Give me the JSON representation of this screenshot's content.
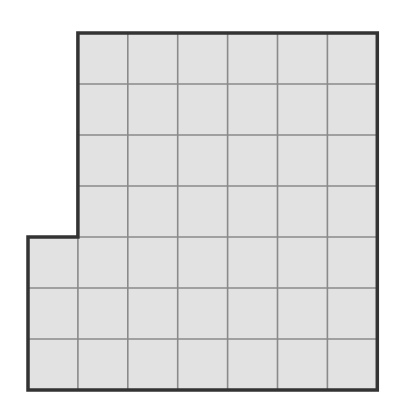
{
  "figure": {
    "type": "grid-polyomino",
    "grid": {
      "origin_x": 28,
      "origin_y": 33,
      "cell_w": 49.9,
      "cell_h": 51,
      "cols": 7,
      "rows": 7
    },
    "cells": [
      [
        0,
        1,
        1,
        1,
        1,
        1,
        1
      ],
      [
        0,
        1,
        1,
        1,
        1,
        1,
        1
      ],
      [
        0,
        1,
        1,
        1,
        1,
        1,
        1
      ],
      [
        0,
        1,
        1,
        1,
        1,
        1,
        1
      ],
      [
        1,
        1,
        1,
        1,
        1,
        1,
        1
      ],
      [
        1,
        1,
        1,
        1,
        1,
        1,
        1
      ],
      [
        1,
        1,
        1,
        1,
        1,
        1,
        1
      ]
    ],
    "cell_count": 45,
    "colors": {
      "fill": "#e2e2e2",
      "grid_line": "#8a8a8a",
      "outline": "#333333",
      "background": "#ffffff"
    }
  }
}
